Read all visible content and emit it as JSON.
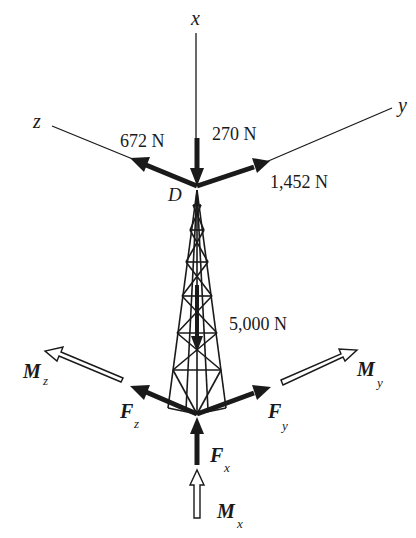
{
  "figure": {
    "axes": [
      {
        "name": "x",
        "label": "x"
      },
      {
        "name": "y",
        "label": "y"
      },
      {
        "name": "z",
        "label": "z"
      }
    ],
    "point_label": "D",
    "applied_loads": [
      {
        "id": "load-x",
        "label": "270 N",
        "direction": "-x"
      },
      {
        "id": "load-z",
        "label": "672 N",
        "direction": "+z"
      },
      {
        "id": "load-y",
        "label": "1,452 N",
        "direction": "+y"
      },
      {
        "id": "load-weight",
        "label": "5,000 N",
        "direction": "-x"
      }
    ],
    "reactions": {
      "forces": [
        {
          "id": "Fx",
          "symbol": "F",
          "subscript": "x"
        },
        {
          "id": "Fy",
          "symbol": "F",
          "subscript": "y"
        },
        {
          "id": "Fz",
          "symbol": "F",
          "subscript": "z"
        }
      ],
      "moments": [
        {
          "id": "Mx",
          "symbol": "M",
          "subscript": "x"
        },
        {
          "id": "My",
          "symbol": "M",
          "subscript": "y"
        },
        {
          "id": "Mz",
          "symbol": "M",
          "subscript": "z"
        }
      ]
    },
    "colors": {
      "ink": "#1a1a1a",
      "background": "#ffffff"
    }
  }
}
